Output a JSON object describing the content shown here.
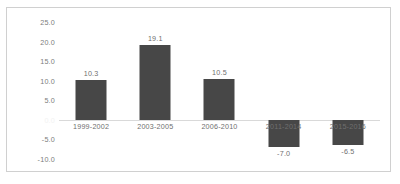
{
  "chart_data": {
    "type": "bar",
    "title": "",
    "subtitle": "",
    "xlabel": "",
    "ylabel": "",
    "categories": [
      "1999-2002",
      "2003-2005",
      "2006-2010",
      "2011-2014",
      "2015-2016"
    ],
    "values": [
      10.3,
      19.1,
      10.5,
      -7.0,
      -6.5
    ],
    "data_labels": [
      "10.3",
      "19.1",
      "10.5",
      "-7.0",
      "-6.5"
    ],
    "ylim": [
      -10.0,
      25.0
    ],
    "ytick_values": [
      25.0,
      20.0,
      15.0,
      10.0,
      5.0,
      0.0,
      -5.0,
      -10.0
    ],
    "ytick_labels": [
      "25.0",
      "20.0",
      "15.0",
      "10.0",
      "5.0",
      "0.0",
      "-5.0",
      "-10.0"
    ],
    "grid": false,
    "legend": false,
    "legend_position": "none",
    "bar_color": "#474747",
    "axis_text_color": "#6f6f6f",
    "zero_line_color": "#d9d9d9",
    "frame_color": "#d0d0d0",
    "category_labels_at_zero": true
  }
}
